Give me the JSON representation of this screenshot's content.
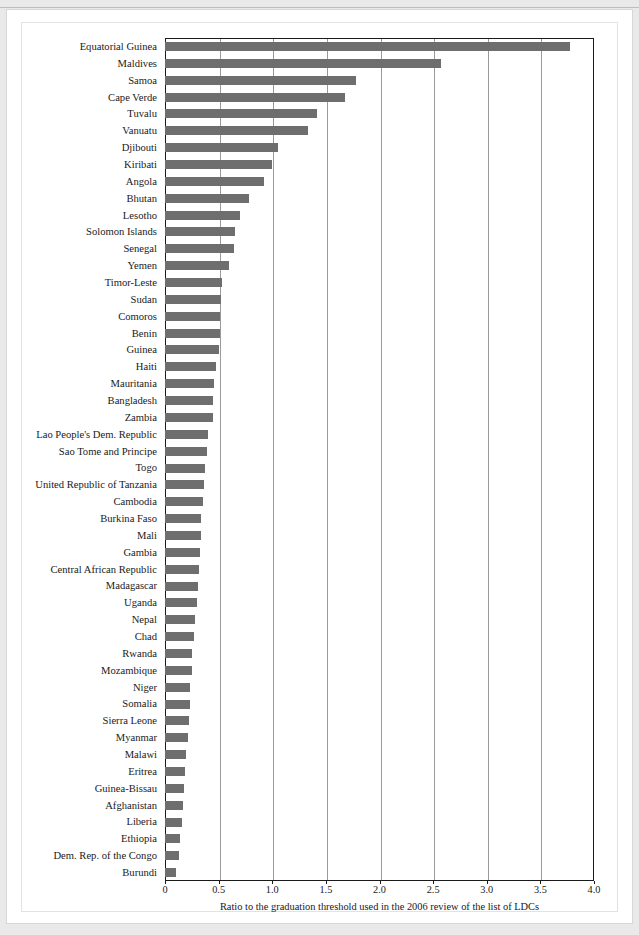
{
  "chart_data": {
    "type": "bar",
    "orientation": "horizontal",
    "title": "",
    "xlabel": "Ratio to the graduation threshold used in the 2006 review of the list of LDCs",
    "ylabel": "",
    "xlim": [
      0,
      4.0
    ],
    "xticks": [
      "0",
      "0.5",
      "1.0",
      "1.5",
      "2.0",
      "2.5",
      "3.0",
      "3.5",
      "4.0"
    ],
    "xtick_values": [
      0,
      0.5,
      1.0,
      1.5,
      2.0,
      2.5,
      3.0,
      3.5,
      4.0
    ],
    "grid": "vertical",
    "legend": "none",
    "bar_color": "#6e6e6e",
    "categories": [
      "Equatorial Guinea",
      "Maldives",
      "Samoa",
      "Cape Verde",
      "Tuvalu",
      "Vanuatu",
      "Djibouti",
      "Kiribati",
      "Angola",
      "Bhutan",
      "Lesotho",
      "Solomon Islands",
      "Senegal",
      "Yemen",
      "Timor-Leste",
      "Sudan",
      "Comoros",
      "Benin",
      "Guinea",
      "Haiti",
      "Mauritania",
      "Bangladesh",
      "Zambia",
      "Lao People's Dem. Republic",
      "Sao Tome and Principe",
      "Togo",
      "United Republic of Tanzania",
      "Cambodia",
      "Burkina Faso",
      "Mali",
      "Gambia",
      "Central African Republic",
      "Madagascar",
      "Uganda",
      "Nepal",
      "Chad",
      "Rwanda",
      "Mozambique",
      "Niger",
      "Somalia",
      "Sierra Leone",
      "Myanmar",
      "Malawi",
      "Eritrea",
      "Guinea-Bissau",
      "Afghanistan",
      "Liberia",
      "Ethiopia",
      "Dem. Rep. of the Congo",
      "Burundi"
    ],
    "values": [
      3.78,
      2.57,
      1.78,
      1.68,
      1.42,
      1.33,
      1.05,
      1.0,
      0.92,
      0.78,
      0.7,
      0.65,
      0.64,
      0.6,
      0.53,
      0.52,
      0.51,
      0.51,
      0.5,
      0.48,
      0.46,
      0.45,
      0.45,
      0.4,
      0.39,
      0.37,
      0.36,
      0.35,
      0.34,
      0.34,
      0.33,
      0.32,
      0.31,
      0.3,
      0.28,
      0.27,
      0.25,
      0.25,
      0.23,
      0.23,
      0.22,
      0.21,
      0.2,
      0.19,
      0.18,
      0.17,
      0.16,
      0.14,
      0.13,
      0.1
    ]
  }
}
